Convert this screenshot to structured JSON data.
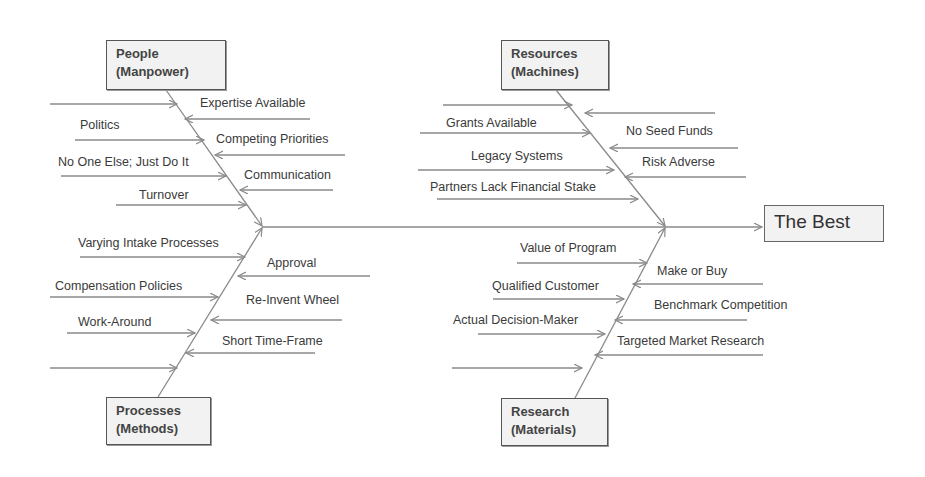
{
  "effect": {
    "label": "The Best"
  },
  "categories": {
    "people": {
      "title": "People",
      "subtitle": "(Manpower)"
    },
    "resources": {
      "title": "Resources",
      "subtitle": "(Machines)"
    },
    "processes": {
      "title": "Processes",
      "subtitle": "(Methods)"
    },
    "research": {
      "title": "Research",
      "subtitle": "(Materials)"
    }
  },
  "causes": {
    "people": {
      "left": [
        "",
        "Politics",
        "No One Else; Just Do It",
        "Turnover"
      ],
      "right": [
        "Expertise Available",
        "Competing Priorities",
        "Communication"
      ]
    },
    "resources": {
      "left": [
        "",
        "Grants Available",
        "Legacy Systems",
        "Partners Lack Financial Stake"
      ],
      "right": [
        "",
        "No Seed Funds",
        "Risk Adverse"
      ]
    },
    "processes": {
      "left": [
        "Varying Intake Processes",
        "Compensation Policies",
        "Work-Around",
        ""
      ],
      "right": [
        "Approval",
        "Re-Invent Wheel",
        "Short Time-Frame"
      ]
    },
    "research": {
      "left": [
        "Value of Program",
        "Qualified Customer",
        "Actual Decision-Maker",
        ""
      ],
      "right": [
        "Make or Buy",
        "Benchmark Competition",
        "Targeted Market Research"
      ]
    }
  },
  "colors": {
    "line": "#8a8a8a",
    "box_fill": "#f2f2f2",
    "box_border": "#555555",
    "text": "#3a3a3a"
  }
}
